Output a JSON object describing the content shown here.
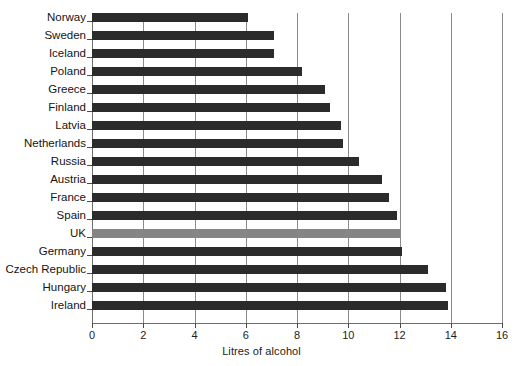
{
  "chart_data": {
    "type": "bar",
    "orientation": "horizontal",
    "title": "",
    "xlabel": "Litres of alcohol",
    "ylabel": "",
    "xlim": [
      0,
      16
    ],
    "xticks": [
      0,
      2,
      4,
      6,
      8,
      10,
      12,
      14,
      16
    ],
    "grid": "vertical",
    "legend": "none",
    "bar_color": "#2b2b2b",
    "highlight_color": "#858585",
    "highlight_category": "UK",
    "categories": [
      "Norway",
      "Sweden",
      "Iceland",
      "Poland",
      "Greece",
      "Finland",
      "Latvia",
      "Netherlands",
      "Russia",
      "Austria",
      "France",
      "Spain",
      "UK",
      "Germany",
      "Czech Republic",
      "Hungary",
      "Ireland"
    ],
    "values": [
      6.1,
      7.1,
      7.1,
      8.2,
      9.1,
      9.3,
      9.7,
      9.8,
      10.4,
      11.3,
      11.6,
      11.9,
      12.0,
      12.1,
      13.1,
      13.8,
      13.9
    ]
  }
}
